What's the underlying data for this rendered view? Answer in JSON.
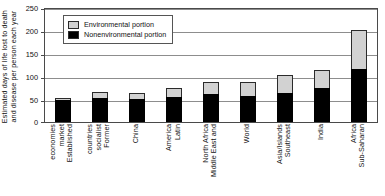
{
  "chart_data": {
    "type": "bar",
    "title": "",
    "subtitle": "",
    "xlabel": "",
    "ylabel": "Estimated days of life lost to death and disease per person each year",
    "ylabel_lines": [
      "Estimated days of life lost to death",
      "and disease per person each year"
    ],
    "ylim": [
      0,
      250
    ],
    "yticks": [
      0,
      50,
      100,
      150,
      200,
      250
    ],
    "grid": true,
    "stacked": true,
    "legend_position": "top-left",
    "categories": [
      "Established market economies",
      "Former socialist countries",
      "China",
      "Latin America",
      "Middle East and North Africa",
      "World",
      "Southeast Asia/Islands",
      "India",
      "Sub-Saharan Africa"
    ],
    "category_lines": [
      [
        "Established",
        "market",
        "economies"
      ],
      [
        "Former",
        "socialist",
        "countries"
      ],
      [
        "China"
      ],
      [
        "Latin",
        "America"
      ],
      [
        "Middle East and",
        "North Africa"
      ],
      [
        "World"
      ],
      [
        "Southeast",
        "Asia/Islands"
      ],
      [
        "India"
      ],
      [
        "Sub-Saharan",
        "Africa"
      ]
    ],
    "series": [
      {
        "name": "Nonenvironmental portion",
        "color": "#000000",
        "values": [
          48,
          54,
          50,
          56,
          61,
          57,
          64,
          75,
          117
        ]
      },
      {
        "name": "Environmental portion",
        "color": "#d2d2d2",
        "values": [
          6,
          12,
          14,
          20,
          28,
          32,
          39,
          41,
          86
        ]
      }
    ],
    "totals": [
      54,
      66,
      64,
      76,
      89,
      89,
      103,
      116,
      203
    ]
  },
  "legend": {
    "items": [
      {
        "label": "Environmental portion",
        "swatch": "light-gray"
      },
      {
        "label": "Nonenvironmental portion",
        "swatch": "black"
      }
    ]
  }
}
